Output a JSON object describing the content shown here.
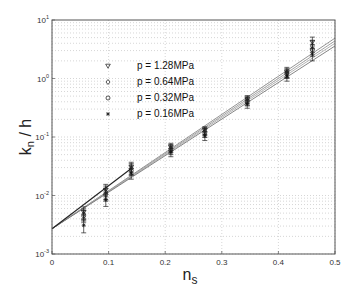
{
  "chart_data": {
    "type": "scatter",
    "title": "",
    "xlabel": "n",
    "xlabel_sub": "s",
    "ylabel": "k",
    "ylabel_sub": "n",
    "ylabel_suffix": " / h",
    "xlim": [
      0,
      0.5
    ],
    "ylim": [
      0.001,
      10
    ],
    "yscale": "log",
    "grid": true,
    "legend_position": "upper left",
    "x_ticks": [
      "0",
      "0.1",
      "0.2",
      "0.3",
      "0.4",
      "0.5"
    ],
    "y_ticks": [
      {
        "base": "10",
        "exp": "1"
      },
      {
        "base": "10",
        "exp": "0"
      },
      {
        "base": "10",
        "exp": "-1"
      },
      {
        "base": "10",
        "exp": "-2"
      },
      {
        "base": "10",
        "exp": "-3"
      }
    ],
    "x": [
      0.056,
      0.095,
      0.14,
      0.21,
      0.27,
      0.345,
      0.415,
      0.46
    ],
    "series": [
      {
        "name": "p = 1.28MPa",
        "marker": "triangle-down",
        "values": [
          0.0052,
          0.0125,
          0.031,
          0.068,
          0.13,
          0.44,
          1.3,
          4.2
        ],
        "err": [
          0.0012,
          0.003,
          0.006,
          0.01,
          0.02,
          0.07,
          0.25,
          0.9
        ]
      },
      {
        "name": "p = 0.64MPa",
        "marker": "diamond",
        "values": [
          0.0048,
          0.0115,
          0.029,
          0.064,
          0.125,
          0.42,
          1.25,
          3.6
        ],
        "err": [
          0.0011,
          0.003,
          0.006,
          0.01,
          0.02,
          0.07,
          0.22,
          0.8
        ]
      },
      {
        "name": "p = 0.32MPa",
        "marker": "circle",
        "values": [
          0.0045,
          0.0105,
          0.027,
          0.06,
          0.118,
          0.4,
          1.2,
          3.1
        ],
        "err": [
          0.001,
          0.0025,
          0.005,
          0.01,
          0.02,
          0.06,
          0.2,
          0.7
        ]
      },
      {
        "name": "p = 0.16MPa",
        "marker": "star",
        "values": [
          0.0031,
          0.0085,
          0.024,
          0.055,
          0.105,
          0.37,
          1.1,
          2.6
        ],
        "err": [
          0.0008,
          0.002,
          0.005,
          0.009,
          0.018,
          0.06,
          0.2,
          0.6
        ]
      }
    ],
    "fit_lines": [
      {
        "name": "fit-1",
        "x": [
          0,
          0.5
        ],
        "y": [
          0.0027,
          4.9
        ],
        "color": "#888888"
      },
      {
        "name": "fit-2",
        "x": [
          0,
          0.5
        ],
        "y": [
          0.0027,
          4.4
        ],
        "color": "#999999"
      },
      {
        "name": "fit-3",
        "x": [
          0,
          0.5
        ],
        "y": [
          0.0027,
          4.0
        ],
        "color": "#aaaaaa"
      },
      {
        "name": "fit-4",
        "x": [
          0,
          0.5
        ],
        "y": [
          0.0027,
          3.6
        ],
        "color": "#777777"
      }
    ]
  },
  "legend": {
    "items": [
      {
        "label": "p = 1.28MPa",
        "marker": "triangle-down"
      },
      {
        "label": "p = 0.64MPa",
        "marker": "diamond"
      },
      {
        "label": "p = 0.32MPa",
        "marker": "circle"
      },
      {
        "label": "p = 0.16MPa",
        "marker": "star"
      }
    ]
  },
  "colors": {
    "axis": "#444444",
    "grid": "#bbbbbb",
    "markers": "#111111",
    "fit_line": "#444444"
  }
}
